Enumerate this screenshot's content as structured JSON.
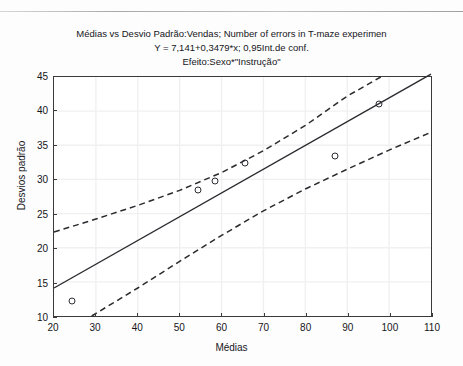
{
  "figure": {
    "title_line1": "Médias vs Desvio Padrão:Vendas; Number of errors in T-maze experimen",
    "title_line2": "Y = 7,141+0,3479*x; 0,95Int.de conf.",
    "title_line3": "Efeito:Sexo*\"Instrução\""
  },
  "scan_artifacts": {
    "ghost_a": "",
    "ghost_b": "",
    "ghost_c": ""
  },
  "chart_data": {
    "type": "scatter",
    "title": "Médias vs Desvio Padrão:Vendas; Number of errors in T-maze experimen",
    "subtitle": "Y = 7,141+0,3479*x; 0,95Int.de conf.",
    "subtitle2": "Efeito:Sexo*\"Instrução\"",
    "xlabel": "Médias",
    "ylabel": "Desvios padrão",
    "xlim": [
      20,
      110
    ],
    "ylim": [
      10,
      45
    ],
    "xticks": [
      20,
      30,
      40,
      50,
      60,
      70,
      80,
      90,
      100,
      110
    ],
    "yticks": [
      10,
      15,
      20,
      25,
      30,
      35,
      40,
      45
    ],
    "grid": true,
    "legend": "none",
    "points": [
      {
        "x": 24.5,
        "y": 12.3
      },
      {
        "x": 54.5,
        "y": 28.5
      },
      {
        "x": 58.5,
        "y": 29.8
      },
      {
        "x": 65.5,
        "y": 32.4
      },
      {
        "x": 87.0,
        "y": 33.4
      },
      {
        "x": 97.5,
        "y": 41.0
      }
    ],
    "series": [
      {
        "name": "Regression line",
        "style": "solid",
        "equation": "Y = 7,141 + 0,3479*x",
        "intercept": 7.141,
        "slope": 0.3479,
        "x": [
          20,
          110
        ],
        "values": [
          14.099,
          45.41
        ]
      },
      {
        "name": "Upper 0,95 confidence band",
        "style": "dashed",
        "x": [
          20,
          30,
          40,
          50,
          60,
          70,
          80,
          90,
          98
        ],
        "values": [
          22.3,
          24.2,
          26.2,
          28.4,
          31.0,
          34.2,
          37.9,
          42.2,
          45.0
        ]
      },
      {
        "name": "Lower 0,95 confidence band",
        "style": "dashed",
        "x": [
          29,
          40,
          50,
          60,
          70,
          80,
          90,
          100,
          110
        ],
        "values": [
          10.0,
          14.1,
          18.0,
          21.8,
          25.4,
          28.6,
          31.5,
          34.3,
          36.9
        ]
      }
    ],
    "confidence_level": 0.95
  }
}
